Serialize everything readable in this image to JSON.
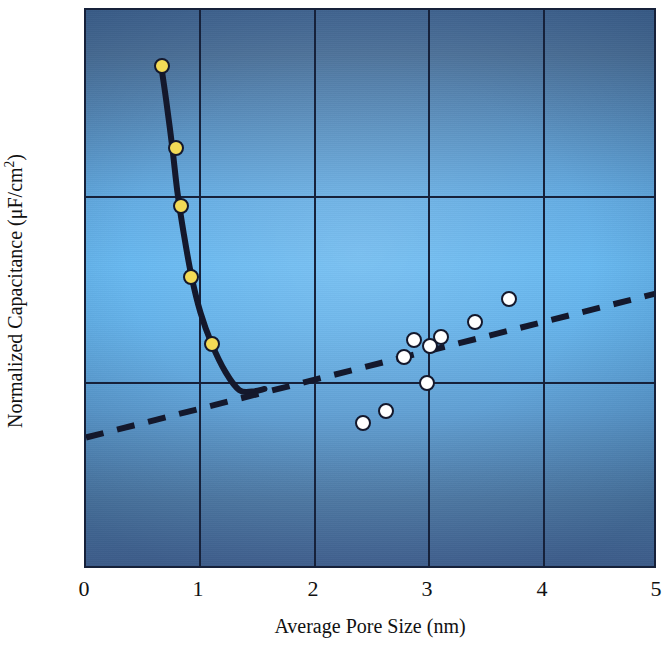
{
  "chart_data": {
    "type": "scatter",
    "title": "",
    "xlabel": "Average Pore Size (nm)",
    "ylabel_parts": {
      "main": "Normalized Capacitance (μF/cm",
      "sup": "2",
      "tail": ")"
    },
    "ylabel": "Normalized Capacitance (μF/cm2)",
    "xlim": [
      0,
      5
    ],
    "ylim": [
      0,
      15
    ],
    "xticks": [
      "0",
      "1",
      "2",
      "3",
      "4",
      "5"
    ],
    "xtick_values": [
      0,
      1,
      2,
      3,
      4,
      5
    ],
    "yticks": [
      "0",
      "5",
      "10",
      "15"
    ],
    "ytick_values": [
      0,
      5,
      10,
      15
    ],
    "grid": "major gridlines at every x tick and every y tick",
    "legend": "none",
    "series": [
      {
        "name": "Carbide-derived carbon (solid curve)",
        "marker": "filled-yellow-circle",
        "marker_color": "#f2da56",
        "marker_edge_color": "#14182c",
        "points": [
          {
            "x": 0.66,
            "y": 13.5
          },
          {
            "x": 0.79,
            "y": 11.3
          },
          {
            "x": 0.83,
            "y": 9.75
          },
          {
            "x": 0.92,
            "y": 7.85
          },
          {
            "x": 1.1,
            "y": 6.05
          }
        ]
      },
      {
        "name": "Activated / mesoporous carbons (open circles)",
        "marker": "open-white-circle",
        "marker_color": "#ffffff",
        "marker_edge_color": "#14182c",
        "points": [
          {
            "x": 2.42,
            "y": 3.95
          },
          {
            "x": 2.62,
            "y": 4.25
          },
          {
            "x": 2.78,
            "y": 5.7
          },
          {
            "x": 2.87,
            "y": 6.15
          },
          {
            "x": 2.98,
            "y": 5.0
          },
          {
            "x": 3.01,
            "y": 6.0
          },
          {
            "x": 3.1,
            "y": 6.25
          },
          {
            "x": 3.4,
            "y": 6.65
          },
          {
            "x": 3.7,
            "y": 7.25
          }
        ]
      }
    ],
    "fits": [
      {
        "name": "solid-trend-curve",
        "style": "solid",
        "color": "#14182c",
        "width": 6,
        "path_points": [
          {
            "x": 0.655,
            "y": 13.55
          },
          {
            "x": 0.7,
            "y": 12.6
          },
          {
            "x": 0.755,
            "y": 11.3
          },
          {
            "x": 0.8,
            "y": 10.1
          },
          {
            "x": 0.855,
            "y": 9.0
          },
          {
            "x": 0.92,
            "y": 7.9
          },
          {
            "x": 1.0,
            "y": 6.9
          },
          {
            "x": 1.1,
            "y": 6.05
          },
          {
            "x": 1.22,
            "y": 5.3
          },
          {
            "x": 1.34,
            "y": 4.82
          },
          {
            "x": 1.45,
            "y": 4.78
          },
          {
            "x": 1.56,
            "y": 4.85
          }
        ]
      },
      {
        "name": "dashed-trend-line",
        "style": "dashed",
        "color": "#14182c",
        "width": 6,
        "dash": "18 14",
        "from": {
          "x": 0.0,
          "y": 3.55
        },
        "to": {
          "x": 5.0,
          "y": 7.42
        }
      }
    ],
    "background": {
      "type": "vertical-gradient",
      "top": "#3f6492",
      "middle": "#62b6f0",
      "bottom": "#48699a",
      "frame_color": "#16213a"
    }
  }
}
